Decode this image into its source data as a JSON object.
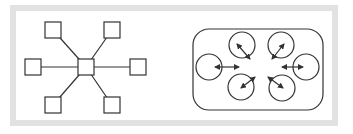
{
  "figure": {
    "frame": {
      "x": 10,
      "y": 5,
      "width": 328,
      "height": 121,
      "thickness": 6,
      "color": "#e2e2e2",
      "fill": "#ffffff"
    },
    "stroke_color": "#333333",
    "star_topology": {
      "hub": {
        "cx": 86,
        "cy": 67,
        "size": 16
      },
      "nodes": [
        {
          "id": "top-left",
          "cx": 53,
          "cy": 30,
          "size": 16
        },
        {
          "id": "top-right",
          "cx": 112,
          "cy": 30,
          "size": 16
        },
        {
          "id": "left",
          "cx": 33,
          "cy": 67,
          "size": 16
        },
        {
          "id": "right",
          "cx": 138,
          "cy": 67,
          "size": 16
        },
        {
          "id": "bottom-left",
          "cx": 53,
          "cy": 105,
          "size": 16
        },
        {
          "id": "bottom-right",
          "cx": 112,
          "cy": 105,
          "size": 16
        }
      ]
    },
    "cluster": {
      "container": {
        "x": 193,
        "y": 29,
        "width": 130,
        "height": 81,
        "radius": 16
      },
      "center": {
        "cx": 262,
        "cy": 67
      },
      "circles": [
        {
          "id": "top-left",
          "cx": 242,
          "cy": 45,
          "r": 13,
          "arrow": {
            "x1": 237,
            "y1": 44,
            "x2": 250,
            "y2": 59
          }
        },
        {
          "id": "top-right",
          "cx": 281,
          "cy": 45,
          "r": 13,
          "arrow": {
            "x1": 284,
            "y1": 44,
            "x2": 272,
            "y2": 59
          }
        },
        {
          "id": "left",
          "cx": 209,
          "cy": 67,
          "r": 13,
          "arrow": {
            "x1": 215,
            "y1": 67,
            "x2": 239,
            "y2": 67
          }
        },
        {
          "id": "right",
          "cx": 306,
          "cy": 67,
          "r": 13,
          "arrow": {
            "x1": 282,
            "y1": 67,
            "x2": 303,
            "y2": 67
          }
        },
        {
          "id": "bottom-left",
          "cx": 241,
          "cy": 87,
          "r": 13,
          "arrow": {
            "x1": 241,
            "y1": 88,
            "x2": 255,
            "y2": 77
          }
        },
        {
          "id": "bottom-right",
          "cx": 282,
          "cy": 88,
          "r": 13,
          "arrow": {
            "x1": 283,
            "y1": 88,
            "x2": 268,
            "y2": 77
          }
        }
      ]
    }
  }
}
